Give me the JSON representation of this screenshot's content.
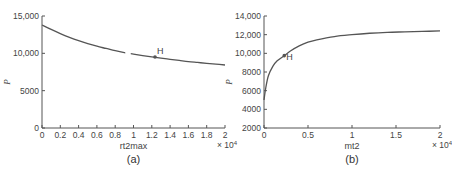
{
  "chart_data": [
    {
      "type": "line",
      "panel_label": "(a)",
      "title": "",
      "xlabel": "rt2max",
      "ylabel": "P",
      "x_multiplier_label": "× 10^4",
      "x_multiplier_base": "× 10",
      "x_multiplier_exp": "4",
      "xlim": [
        0,
        2
      ],
      "ylim": [
        0,
        15000
      ],
      "xticks": [
        "0",
        "0.2",
        "0.4",
        "0.6",
        "0.8",
        "1",
        "1.2",
        "1.4",
        "1.6",
        "1.8",
        "2"
      ],
      "yticks": [
        "0",
        "5000",
        "10,000",
        "15,000"
      ],
      "grid": false,
      "series": [
        {
          "name": "P vs rt2max",
          "x": [
            0,
            0.1,
            0.2,
            0.3,
            0.4,
            0.5,
            0.6,
            0.7,
            0.8,
            0.9,
            1.0,
            1.1,
            1.2,
            1.3,
            1.4,
            1.5,
            1.6,
            1.7,
            1.8,
            1.9,
            2.0
          ],
          "y": [
            13800,
            13200,
            12650,
            12150,
            11700,
            11300,
            10950,
            10650,
            10350,
            10100,
            9900,
            9700,
            9520,
            9350,
            9200,
            9050,
            8900,
            8780,
            8660,
            8550,
            8440
          ]
        }
      ],
      "annotations": [
        {
          "label": "H",
          "x": 1.235,
          "y": 9500
        }
      ]
    },
    {
      "type": "line",
      "panel_label": "(b)",
      "title": "",
      "xlabel": "mt2",
      "ylabel": "P",
      "x_multiplier_label": "× 10^4",
      "x_multiplier_base": "× 10",
      "x_multiplier_exp": "4",
      "xlim": [
        0,
        2
      ],
      "ylim": [
        2000,
        14000
      ],
      "xticks": [
        "0",
        "0.5",
        "1",
        "1.5",
        "2"
      ],
      "yticks": [
        "2000",
        "4000",
        "6000",
        "8000",
        "10,000",
        "12,000",
        "14,000"
      ],
      "grid": false,
      "series": [
        {
          "name": "P vs mt2",
          "x": [
            0,
            0.02,
            0.05,
            0.1,
            0.15,
            0.23,
            0.3,
            0.4,
            0.5,
            0.6,
            0.8,
            1.0,
            1.2,
            1.4,
            1.6,
            1.8,
            2.0
          ],
          "y": [
            5000,
            6300,
            7600,
            8600,
            9200,
            9750,
            10250,
            10800,
            11200,
            11450,
            11800,
            12000,
            12150,
            12250,
            12300,
            12350,
            12400
          ]
        }
      ],
      "annotations": [
        {
          "label": "H",
          "x": 0.23,
          "y": 9750
        }
      ]
    }
  ]
}
